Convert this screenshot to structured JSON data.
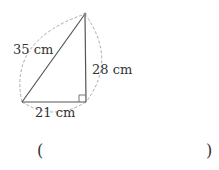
{
  "figure": {
    "type": "right-triangle",
    "hypotenuse_label": "35 cm",
    "height_label": "28 cm",
    "base_label": "21 cm",
    "line_color": "#555555",
    "dashed_color": "#aaaaaa"
  },
  "answer": {
    "open_paren": "(",
    "close_paren": ")",
    "value": ""
  }
}
